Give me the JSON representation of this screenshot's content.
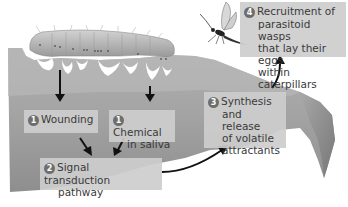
{
  "diagram": {
    "steps": [
      {
        "id": "wounding",
        "number": "1",
        "line1": "Wounding",
        "line2": ""
      },
      {
        "id": "chemical",
        "number": "1",
        "line1": "Chemical",
        "line2": "in saliva"
      },
      {
        "id": "signal",
        "number": "2",
        "line1": "Signal transduction",
        "line2": "pathway"
      },
      {
        "id": "synthesis",
        "number": "3",
        "line1": "Synthesis",
        "line2": "and release",
        "line3": "of volatile",
        "line4": "attractants"
      },
      {
        "id": "recruitment",
        "number": "4",
        "line1": "Recruitment of",
        "line2": "parasitoid wasps",
        "line3": "that lay their eggs",
        "line4": "within caterpillars"
      }
    ],
    "elements": {
      "organism_top": "caterpillar",
      "organism_flying": "parasitoid wasp",
      "substrate": "leaf"
    },
    "flow": [
      {
        "from": "wounding",
        "to": "signal"
      },
      {
        "from": "chemical",
        "to": "signal"
      },
      {
        "from": "signal",
        "to": "synthesis"
      },
      {
        "from": "synthesis",
        "to": "recruitment"
      }
    ],
    "colors": {
      "leaf": "#9a9a9a",
      "leaf_light": "#b4b4b4",
      "box": "#cdcdcd",
      "badge": "#6e6e6e",
      "text": "#3a3a3a",
      "arrow": "#111111"
    }
  }
}
